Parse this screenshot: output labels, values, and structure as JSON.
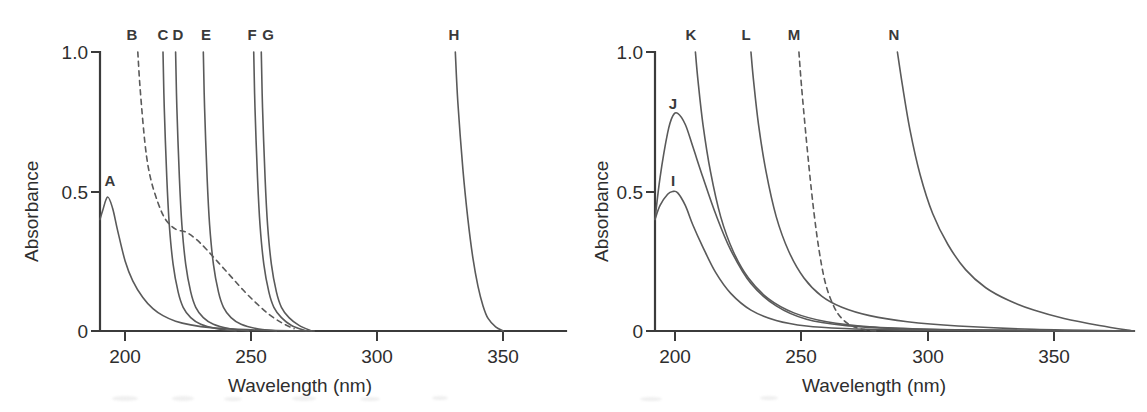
{
  "figure": {
    "background_color": "#ffffff",
    "curve_color": "#5a5a5a",
    "axis_color": "#3b3b3b",
    "text_color": "#2e2e2e"
  },
  "panels": [
    {
      "id": "left",
      "axes": {
        "xlabel": "Wavelength (nm)",
        "ylabel": "Absorbance",
        "xticks": [
          200,
          250,
          300,
          350
        ],
        "xtick_labels": [
          "200",
          "250",
          "300",
          "350"
        ],
        "yticks": [
          0,
          0.5,
          1.0
        ],
        "ytick_labels": [
          "0",
          "0.5",
          "1.0"
        ],
        "xlim": [
          190,
          380
        ],
        "ylim": [
          0,
          1.0
        ],
        "grid": false
      },
      "curves": [
        {
          "label": "A",
          "style": "solid",
          "cutoff_nm": 190,
          "peak_nm": 193,
          "peak_absorbance": 0.48,
          "label_x_nm": 194
        },
        {
          "label": "B",
          "style": "dashed",
          "cutoff_nm": 205,
          "shoulder_absorbance": 0.36,
          "label_x_nm": 203
        },
        {
          "label": "C",
          "style": "solid",
          "cutoff_nm": 215,
          "label_x_nm": 214
        },
        {
          "label": "D",
          "style": "solid",
          "cutoff_nm": 220,
          "label_x_nm": 220
        },
        {
          "label": "E",
          "style": "solid",
          "cutoff_nm": 231,
          "label_x_nm": 231
        },
        {
          "label": "F",
          "style": "solid",
          "cutoff_nm": 251,
          "label_x_nm": 251
        },
        {
          "label": "G",
          "style": "solid",
          "cutoff_nm": 254,
          "label_x_nm": 255
        },
        {
          "label": "H",
          "style": "solid",
          "cutoff_nm": 331,
          "label_x_nm": 331
        }
      ]
    },
    {
      "id": "right",
      "axes": {
        "xlabel": "Wavelength (nm)",
        "ylabel": "Absorbance",
        "xticks": [
          200,
          250,
          300,
          350
        ],
        "xtick_labels": [
          "200",
          "250",
          "300",
          "350"
        ],
        "yticks": [
          0,
          0.5,
          1.0
        ],
        "ytick_labels": [
          "0",
          "0.5",
          "1.0"
        ],
        "xlim": [
          190,
          382
        ],
        "ylim": [
          0,
          1.0
        ],
        "grid": false
      },
      "curves": [
        {
          "label": "I",
          "style": "solid",
          "peak_nm": 199,
          "peak_absorbance": 0.5,
          "label_x_nm": 198
        },
        {
          "label": "J",
          "style": "solid",
          "peak_nm": 199,
          "peak_absorbance": 0.78,
          "label_x_nm": 198
        },
        {
          "label": "K",
          "style": "solid",
          "cutoff_nm": 206,
          "label_x_nm": 206
        },
        {
          "label": "L",
          "style": "solid",
          "cutoff_nm": 228,
          "label_x_nm": 228
        },
        {
          "label": "M",
          "style": "dashed",
          "cutoff_nm": 247,
          "label_x_nm": 247
        },
        {
          "label": "N",
          "style": "solid",
          "cutoff_nm": 286,
          "label_x_nm": 286
        }
      ]
    }
  ],
  "chart_data": {
    "type": "line",
    "xlabel": "Wavelength (nm)",
    "ylabel": "Absorbance",
    "xlim": [
      190,
      380
    ],
    "ylim": [
      0,
      1.0
    ],
    "xticks": [
      200,
      250,
      300,
      350
    ],
    "yticks": [
      0,
      0.5,
      1.0
    ],
    "grid": false,
    "legend_position": "inline-curve-labels",
    "panels": [
      {
        "panel": "left",
        "series": [
          {
            "name": "A",
            "style": "solid",
            "x": [
              190,
              191,
              193,
              195,
              197,
              200,
              203,
              207,
              211,
              215,
              220,
              226,
              234,
              245,
              260,
              275
            ],
            "values": [
              0.4,
              0.43,
              0.48,
              0.44,
              0.36,
              0.25,
              0.18,
              0.12,
              0.08,
              0.055,
              0.035,
              0.022,
              0.012,
              0.006,
              0.002,
              0.0
            ]
          },
          {
            "name": "B",
            "style": "dashed",
            "x": [
              205,
              206,
              208,
              210,
              213,
              216,
              220,
              224,
              228,
              232,
              237,
              242,
              247,
              252,
              257,
              262,
              267
            ],
            "values": [
              1.0,
              0.86,
              0.66,
              0.55,
              0.46,
              0.4,
              0.365,
              0.355,
              0.33,
              0.295,
              0.245,
              0.195,
              0.145,
              0.1,
              0.06,
              0.03,
              0.008
            ]
          },
          {
            "name": "C",
            "style": "solid",
            "x": [
              215,
              215.5,
              216.5,
              217.5,
              219,
              221,
              223,
              226,
              230,
              236,
              244
            ],
            "values": [
              1.0,
              0.8,
              0.55,
              0.38,
              0.24,
              0.14,
              0.085,
              0.048,
              0.024,
              0.009,
              0.0
            ]
          },
          {
            "name": "D",
            "style": "solid",
            "x": [
              220,
              220.5,
              221.5,
              222.5,
              224,
              226,
              228,
              231,
              235,
              241,
              249
            ],
            "values": [
              1.0,
              0.8,
              0.55,
              0.38,
              0.24,
              0.14,
              0.085,
              0.048,
              0.024,
              0.009,
              0.0
            ]
          },
          {
            "name": "E",
            "style": "solid",
            "x": [
              231,
              231.5,
              232.5,
              233.5,
              235,
              237,
              239,
              242,
              246,
              252,
              260
            ],
            "values": [
              1.0,
              0.8,
              0.55,
              0.38,
              0.24,
              0.14,
              0.085,
              0.048,
              0.024,
              0.009,
              0.0
            ]
          },
          {
            "name": "F",
            "style": "solid",
            "x": [
              251,
              251.5,
              252.5,
              253.5,
              255,
              257,
              259,
              262,
              266,
              272
            ],
            "values": [
              1.0,
              0.8,
              0.55,
              0.38,
              0.24,
              0.14,
              0.085,
              0.048,
              0.02,
              0.0
            ]
          },
          {
            "name": "G",
            "style": "solid",
            "x": [
              254,
              254.5,
              255.5,
              256.5,
              258,
              260,
              262,
              265,
              269,
              274
            ],
            "values": [
              1.0,
              0.8,
              0.55,
              0.38,
              0.24,
              0.14,
              0.085,
              0.048,
              0.02,
              0.0
            ]
          },
          {
            "name": "H",
            "style": "solid",
            "x": [
              331,
              332,
              334,
              336,
              338,
              340,
              342,
              344,
              347,
              350
            ],
            "values": [
              1.0,
              0.82,
              0.58,
              0.4,
              0.26,
              0.16,
              0.09,
              0.045,
              0.015,
              0.0
            ]
          }
        ]
      },
      {
        "panel": "right",
        "series": [
          {
            "name": "I",
            "style": "solid",
            "x": [
              190,
              192,
              195,
              197,
              199,
              202,
              205,
              209,
              214,
              220,
              228,
              238,
              250,
              265,
              285,
              310,
              340,
              382
            ],
            "values": [
              0.4,
              0.45,
              0.49,
              0.5,
              0.495,
              0.45,
              0.38,
              0.3,
              0.21,
              0.135,
              0.075,
              0.038,
              0.018,
              0.009,
              0.004,
              0.002,
              0.001,
              0.0
            ]
          },
          {
            "name": "J",
            "style": "solid",
            "x": [
              190,
              192,
              195,
              197,
              199,
              202,
              205,
              209,
              214,
              220,
              228,
              238,
              250,
              265,
              285,
              310,
              340,
              382
            ],
            "values": [
              0.4,
              0.55,
              0.71,
              0.77,
              0.78,
              0.74,
              0.66,
              0.55,
              0.42,
              0.29,
              0.17,
              0.09,
              0.042,
              0.02,
              0.009,
              0.004,
              0.002,
              0.0
            ]
          },
          {
            "name": "K",
            "style": "solid",
            "x": [
              206,
              207,
              209,
              212,
              216,
              221,
              227,
              235,
              245,
              258,
              275,
              300,
              330,
              382
            ],
            "values": [
              1.0,
              0.9,
              0.74,
              0.57,
              0.41,
              0.285,
              0.19,
              0.115,
              0.065,
              0.033,
              0.015,
              0.006,
              0.002,
              0.0
            ]
          },
          {
            "name": "L",
            "style": "solid",
            "x": [
              228,
              229,
              231,
              234,
              238,
              243,
              249,
              256,
              264,
              275,
              290,
              310,
              340,
              382
            ],
            "values": [
              1.0,
              0.9,
              0.74,
              0.57,
              0.41,
              0.285,
              0.19,
              0.125,
              0.085,
              0.055,
              0.033,
              0.018,
              0.006,
              0.0
            ]
          },
          {
            "name": "M",
            "style": "dashed",
            "x": [
              247,
              248,
              250,
              252,
              254,
              256,
              258,
              261,
              264,
              268,
              273,
              278
            ],
            "values": [
              1.0,
              0.88,
              0.68,
              0.5,
              0.35,
              0.235,
              0.155,
              0.085,
              0.045,
              0.018,
              0.005,
              0.0
            ]
          },
          {
            "name": "N",
            "style": "solid",
            "x": [
              286,
              288,
              291,
              295,
              300,
              306,
              313,
              321,
              330,
              340,
              352,
              366,
              382
            ],
            "values": [
              1.0,
              0.88,
              0.72,
              0.56,
              0.42,
              0.31,
              0.22,
              0.155,
              0.11,
              0.075,
              0.045,
              0.02,
              0.0
            ]
          }
        ]
      }
    ]
  }
}
